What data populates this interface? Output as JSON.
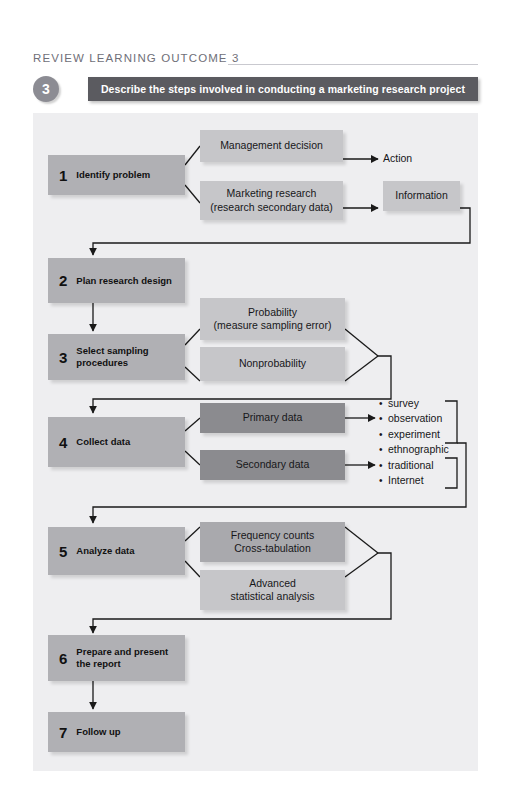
{
  "header": {
    "title": "Review Learning Outcome 3",
    "objective_number": "3",
    "objective_text": "Describe the steps involved in conducting a marketing research project"
  },
  "colors": {
    "page_background": "#ffffff",
    "panel_background": "#eeeef0",
    "objective_bar": "#5b5b60",
    "objective_badge": "#8c8c93",
    "step_box": "#b0b0b4",
    "sub_box_light": "#c6c6c9",
    "sub_box_mid": "#a9a9ad",
    "sub_box_dark": "#8b8b8f",
    "title_text": "#6f6f78",
    "connector_line": "#1a1a1a"
  },
  "flow": {
    "steps": [
      {
        "num": "1",
        "label": "Identify problem"
      },
      {
        "num": "2",
        "label": "Plan research design"
      },
      {
        "num": "3",
        "label": "Select sampling\nprocedures"
      },
      {
        "num": "4",
        "label": "Collect data"
      },
      {
        "num": "5",
        "label": "Analyze data"
      },
      {
        "num": "6",
        "label": "Prepare and present\nthe report"
      },
      {
        "num": "7",
        "label": "Follow up"
      }
    ],
    "boxes": {
      "management_decision": "Management decision",
      "marketing_research": "Marketing research\n(research secondary data)",
      "information": "Information",
      "probability": "Probability\n(measure sampling error)",
      "nonprobability": "Nonprobability",
      "primary_data": "Primary data",
      "secondary_data": "Secondary data",
      "frequency_counts": "Frequency counts\nCross-tabulation",
      "advanced_statistical": "Advanced\nstatistical analysis"
    },
    "labels": {
      "action": "Action"
    },
    "bullets": {
      "primary": [
        "survey",
        "observation",
        "experiment",
        "ethnographic"
      ],
      "secondary": [
        "traditional",
        "Internet"
      ]
    }
  }
}
